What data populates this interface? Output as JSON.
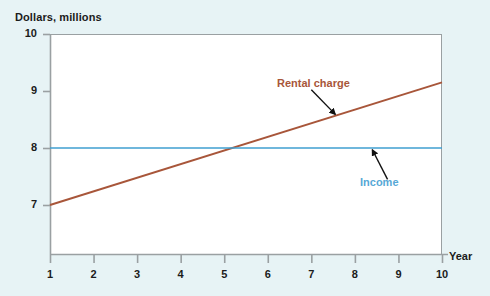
{
  "chart_data": {
    "type": "line",
    "title": "",
    "xlabel": "Year",
    "ylabel": "Dollars, millions",
    "xlim": [
      1,
      10
    ],
    "ylim": [
      6.3,
      10
    ],
    "xticks": [
      1,
      2,
      3,
      4,
      5,
      6,
      7,
      8,
      9,
      10
    ],
    "yticks": [
      7,
      8,
      9,
      10
    ],
    "xticklabels": [
      "1",
      "2",
      "3",
      "4",
      "5",
      "6",
      "7",
      "8",
      "9",
      "10"
    ],
    "yticklabels": [
      "7",
      "8",
      "9",
      "10"
    ],
    "grid": false,
    "legend_position": "inline-annotations",
    "x": [
      1,
      10
    ],
    "series": [
      {
        "name": "Rental charge",
        "color": "#a8563a",
        "values": [
          7.0,
          9.15
        ],
        "x": [
          1,
          10
        ]
      },
      {
        "name": "Income",
        "color": "#3f9fd0",
        "values": [
          8.0,
          8.0
        ],
        "x": [
          1,
          10
        ]
      }
    ],
    "annotations": [
      {
        "text": "Rental charge",
        "color": "#a8563a",
        "arrow_from": [
          7.0,
          9.02
        ],
        "arrow_to": [
          7.55,
          8.59
        ]
      },
      {
        "text": "Income",
        "color": "#57a8d6",
        "arrow_from": [
          8.75,
          7.45
        ],
        "arrow_to": [
          8.4,
          7.97
        ]
      }
    ],
    "intersection": {
      "x": 5.6,
      "y": 8.0
    }
  },
  "axes": {
    "y_title": "Dollars, millions",
    "x_title": "Year"
  },
  "colors": {
    "background": "#e7f3f5",
    "plot_background": "#ffffff",
    "frame": "#9aa0a2",
    "rental": "#a8563a",
    "income": "#3f9fd0",
    "text": "#1b1b1b",
    "arrow": "#111111"
  }
}
